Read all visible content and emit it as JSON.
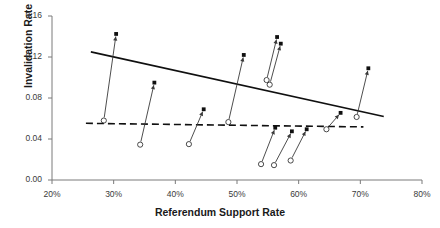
{
  "chart_data": {
    "type": "scatter",
    "title": "",
    "xlabel": "Referendum Support Rate",
    "ylabel": "Invalidation Rate",
    "xlim": [
      20,
      80
    ],
    "ylim": [
      0.0,
      0.16
    ],
    "xtick_labels": [
      "20%",
      "30%",
      "40%",
      "50%",
      "60%",
      "70%",
      "80%"
    ],
    "xtick_values": [
      20,
      30,
      40,
      50,
      60,
      70,
      80
    ],
    "ytick_labels": [
      "0.00",
      "0.04",
      "0.08",
      "0.12",
      "0.16"
    ],
    "ytick_values": [
      0.0,
      0.04,
      0.08,
      0.12,
      0.16
    ],
    "grid": false,
    "legend": "none",
    "marker_start": "open-circle",
    "marker_end": "filled-square",
    "series": [
      {
        "name": "Invalidation rate change (arrow: before -> after)",
        "points": [
          {
            "x_start": 28.4,
            "y_start": 0.058,
            "x_end": 30.4,
            "y_end": 0.1425
          },
          {
            "x_start": 34.3,
            "y_start": 0.0345,
            "x_end": 36.6,
            "y_end": 0.095
          },
          {
            "x_start": 42.2,
            "y_start": 0.035,
            "x_end": 44.6,
            "y_end": 0.069
          },
          {
            "x_start": 48.6,
            "y_start": 0.0565,
            "x_end": 51.1,
            "y_end": 0.122
          },
          {
            "x_start": 54.8,
            "y_start": 0.0975,
            "x_end": 56.5,
            "y_end": 0.1395
          },
          {
            "x_start": 55.3,
            "y_start": 0.093,
            "x_end": 57.1,
            "y_end": 0.133
          },
          {
            "x_start": 53.9,
            "y_start": 0.0155,
            "x_end": 56.2,
            "y_end": 0.051
          },
          {
            "x_start": 56.0,
            "y_start": 0.0145,
            "x_end": 58.9,
            "y_end": 0.0475
          },
          {
            "x_start": 58.7,
            "y_start": 0.019,
            "x_end": 61.3,
            "y_end": 0.0495
          },
          {
            "x_start": 64.5,
            "y_start": 0.0495,
            "x_end": 66.8,
            "y_end": 0.0655
          },
          {
            "x_start": 69.4,
            "y_start": 0.0615,
            "x_end": 71.3,
            "y_end": 0.109
          }
        ]
      }
    ],
    "trend_lines": [
      {
        "name": "upper-trend-solid",
        "style": "solid",
        "x1": 26.3,
        "y1": 0.125,
        "x2": 73.8,
        "y2": 0.062
      },
      {
        "name": "lower-trend-dashed",
        "style": "dashed",
        "x1": 25.5,
        "y1": 0.0553,
        "x2": 70.5,
        "y2": 0.0518
      }
    ]
  },
  "axis": {
    "y_title": "Invalidation Rate",
    "x_title": "Referendum Support Rate"
  }
}
